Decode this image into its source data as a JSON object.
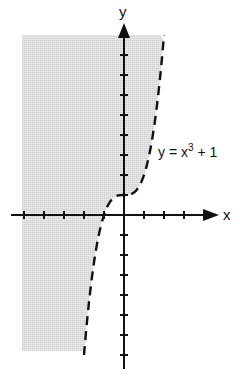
{
  "graph": {
    "x_axis_label": "x",
    "y_axis_label": "y",
    "equation_label_prefix": "y = x",
    "equation_label_exponent": "3",
    "equation_label_suffix": " + 1",
    "curve_style": "dashed",
    "shading": "region left of / above curve (y > x^3 + 1)",
    "colors": {
      "axis": "#111111",
      "curve": "#111111",
      "shade": "#d9d9d9"
    }
  },
  "chart_data": {
    "type": "line",
    "title": "",
    "xlabel": "x",
    "ylabel": "y",
    "series": [
      {
        "name": "y = x^3 + 1",
        "style": "dashed",
        "x": [
          -2,
          -1.5,
          -1,
          -0.5,
          0,
          0.5,
          1,
          1.5,
          2
        ],
        "y": [
          -7,
          -2.375,
          0,
          0.875,
          1,
          1.125,
          2,
          4.375,
          9
        ]
      }
    ],
    "shaded_region": "y > x^3 + 1 (left of curve)",
    "xlim": [
      -5.5,
      4.7
    ],
    "ylim": [
      -7.7,
      9.5
    ],
    "x_ticks": [
      -5,
      -4,
      -3,
      -2,
      -1,
      1,
      2,
      3
    ],
    "y_ticks": [
      -7,
      -6,
      -5,
      -4,
      -3,
      -2,
      -1,
      1,
      2,
      3,
      4,
      5,
      6,
      7,
      8
    ],
    "grid": false,
    "legend": "none"
  }
}
